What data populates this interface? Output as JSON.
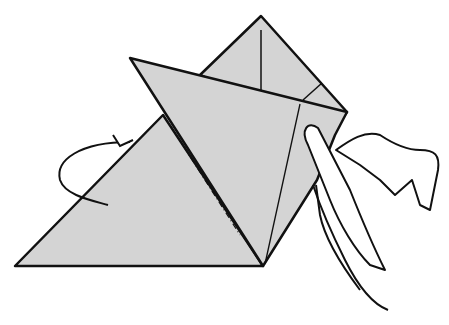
{
  "figure": {
    "type": "origami-instruction-illustration",
    "paper_color": "#d4d4d4",
    "line_color": "#111111",
    "background": "#ffffff",
    "elements": [
      "back-triangle",
      "upper-flap-square",
      "front-folded-flap",
      "rotation-arrow",
      "hand"
    ]
  }
}
